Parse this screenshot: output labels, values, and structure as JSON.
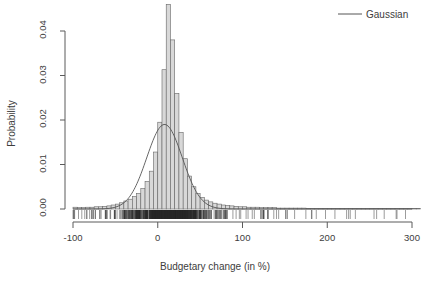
{
  "chart_data": {
    "type": "bar",
    "title": "",
    "xlabel": "Budgetary change (in %)",
    "ylabel": "Probability",
    "xlim": [
      -100,
      310
    ],
    "ylim": [
      0,
      0.047
    ],
    "xticks": [
      -100,
      0,
      100,
      200,
      300
    ],
    "xtick_labels": [
      "-100",
      "0",
      "100",
      "200",
      "300"
    ],
    "yticks": [
      0.0,
      0.01,
      0.02,
      0.03,
      0.04
    ],
    "ytick_labels": [
      "0.00",
      "0.01",
      "0.02",
      "0.03",
      "0.04"
    ],
    "grid": false,
    "legend_position": "top-right",
    "legend": [
      {
        "label": "Gaussian",
        "marker": "line",
        "color": "#555555"
      }
    ],
    "bin_width": 5,
    "bin_starts": [
      -100,
      -95,
      -90,
      -85,
      -80,
      -75,
      -70,
      -65,
      -60,
      -55,
      -50,
      -45,
      -40,
      -35,
      -30,
      -25,
      -20,
      -15,
      -10,
      -5,
      0,
      5,
      10,
      15,
      20,
      25,
      30,
      35,
      40,
      45,
      50,
      55,
      60,
      65,
      70,
      75,
      80,
      85,
      90,
      95,
      100,
      105,
      110,
      115,
      120,
      125,
      130,
      135,
      140,
      145,
      150,
      155,
      160,
      165,
      170,
      175,
      180,
      185,
      190,
      195,
      200,
      205,
      210,
      215,
      220,
      225,
      230,
      235,
      240,
      245,
      250,
      255,
      260,
      265,
      270,
      275,
      280,
      285,
      290,
      295,
      300,
      305
    ],
    "values": [
      0.0004,
      0.0003,
      0.0003,
      0.0004,
      0.0004,
      0.0005,
      0.0005,
      0.0006,
      0.0007,
      0.0009,
      0.0011,
      0.0014,
      0.0018,
      0.0022,
      0.0028,
      0.0035,
      0.0046,
      0.0062,
      0.0085,
      0.0128,
      0.0195,
      0.0313,
      0.046,
      0.038,
      0.026,
      0.0172,
      0.0113,
      0.0074,
      0.005,
      0.0035,
      0.0026,
      0.002,
      0.0016,
      0.0013,
      0.0011,
      0.0009,
      0.0008,
      0.0007,
      0.0006,
      0.0005,
      0.0005,
      0.0004,
      0.0004,
      0.0004,
      0.0003,
      0.0003,
      0.0003,
      0.0003,
      0.0002,
      0.0002,
      0.0002,
      0.0002,
      0.0002,
      0.0002,
      0.0002,
      0.0001,
      0.0001,
      0.0001,
      0.0001,
      0.0001,
      0.0001,
      0.0001,
      0.0001,
      0.0001,
      0.0001,
      0.0001,
      0.0001,
      0.0001,
      0.0001,
      0.0001,
      0.0001,
      0.0001,
      0.0001,
      0.0001,
      0.0001,
      0.0001,
      0.0001,
      0.0001,
      0.0001,
      0.0001,
      0.0001,
      0.0001
    ],
    "overlay_curve": {
      "name": "Gaussian",
      "mean": 8,
      "sd": 21,
      "peak_value": 0.019,
      "color": "#555555"
    },
    "rug": {
      "present": true,
      "description": "dense rug of individual observations along the x-axis baseline",
      "color": "#2a2a2a"
    },
    "colors": {
      "bar_fill": "#d8d8d8",
      "bar_stroke": "#666666",
      "axis": "#5a5a5a",
      "text": "#3d3d3d",
      "curve": "#555555"
    }
  }
}
